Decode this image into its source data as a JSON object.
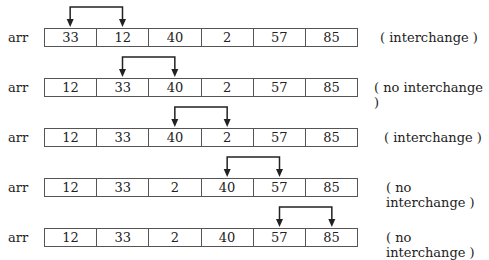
{
  "rows": [
    {
      "label": "arr",
      "values": [
        "33",
        "12",
        "40",
        "2",
        "57",
        "85"
      ],
      "compare": [
        0,
        1
      ],
      "note": "( interchange )",
      "note_x": 380
    },
    {
      "label": "arr",
      "values": [
        "12",
        "33",
        "40",
        "2",
        "57",
        "85"
      ],
      "compare": [
        1,
        2
      ],
      "note": "( no interchange )",
      "note_x": 374
    },
    {
      "label": "arr",
      "values": [
        "12",
        "33",
        "40",
        "2",
        "57",
        "85"
      ],
      "compare": [
        2,
        3
      ],
      "note": "( interchange )",
      "note_x": 384
    },
    {
      "label": "arr",
      "values": [
        "12",
        "33",
        "2",
        "40",
        "57",
        "85"
      ],
      "compare": [
        3,
        4
      ],
      "note": "( no interchange )",
      "note_x": 386
    },
    {
      "label": "arr",
      "values": [
        "12",
        "33",
        "2",
        "40",
        "57",
        "85"
      ],
      "compare": [
        4,
        5
      ],
      "note": "( no interchange )",
      "note_x": 386
    }
  ]
}
